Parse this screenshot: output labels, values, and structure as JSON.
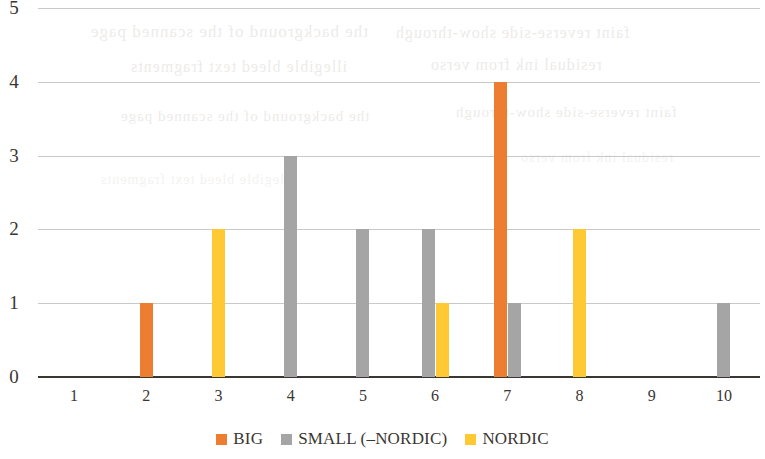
{
  "chart_data": {
    "type": "bar",
    "title": "",
    "subtitle": "",
    "xlabel": "",
    "ylabel": "",
    "categories": [
      "1",
      "2",
      "3",
      "4",
      "5",
      "6",
      "7",
      "8",
      "9",
      "10"
    ],
    "series": [
      {
        "name": "BIG",
        "color": "#ED7D31",
        "values": [
          0,
          1,
          0,
          0,
          0,
          0,
          4,
          0,
          0,
          0
        ]
      },
      {
        "name": "SMALL (–NORDIC)",
        "color": "#A5A5A5",
        "values": [
          0,
          0,
          0,
          3,
          2,
          2,
          1,
          0,
          0,
          1
        ]
      },
      {
        "name": "NORDIC",
        "color": "#FFC933",
        "values": [
          0,
          0,
          2,
          0,
          0,
          1,
          0,
          2,
          0,
          0
        ]
      }
    ],
    "y_ticks": [
      "0",
      "1",
      "2",
      "3",
      "4",
      "5"
    ],
    "ylim": [
      0,
      5
    ],
    "grid": true,
    "legend_position": "bottom",
    "axis_color": "#3A3632",
    "grid_color": "#BFBFBF"
  },
  "legend": {
    "items": [
      {
        "label": "BIG",
        "color": "#ED7D31"
      },
      {
        "label": "SMALL (–NORDIC)",
        "color": "#A5A5A5"
      },
      {
        "label": "NORDIC",
        "color": "#FFC933"
      }
    ]
  },
  "ghost_text": {
    "lines": [
      "the background of the scanned page",
      "faint reverse-side show-through",
      "illegible bleed text fragments",
      "residual ink from verso"
    ]
  }
}
